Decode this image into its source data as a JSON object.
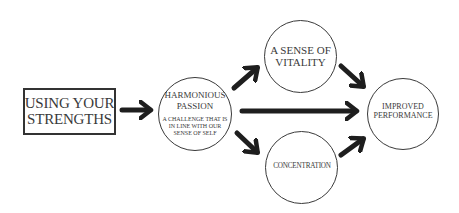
{
  "diagram": {
    "colors": {
      "stroke": "#333333",
      "text": "#3a3a3a",
      "arrow": "#1e1e1e",
      "background": "#ffffff"
    },
    "nodes": [
      {
        "id": "strengths",
        "shape": "rectangle",
        "lines": [
          "USING YOUR",
          "STRENGTHS"
        ]
      },
      {
        "id": "passion",
        "shape": "circle",
        "lines": [
          "HARMONIOUS",
          "PASSION"
        ],
        "sublines": [
          "A CHALLENGE THAT IS",
          "IN LINE WITH OUR",
          "SENSE OF SELF"
        ]
      },
      {
        "id": "vitality",
        "shape": "circle",
        "lines": [
          "A SENSE OF",
          "VITALITY"
        ]
      },
      {
        "id": "concentration",
        "shape": "circle",
        "lines": [
          "CONCENTRATION"
        ]
      },
      {
        "id": "performance",
        "shape": "circle",
        "lines": [
          "IMPROVED",
          "PERFORMANCE"
        ]
      }
    ],
    "edges": [
      {
        "from": "strengths",
        "to": "passion"
      },
      {
        "from": "passion",
        "to": "vitality"
      },
      {
        "from": "passion",
        "to": "performance"
      },
      {
        "from": "passion",
        "to": "concentration"
      },
      {
        "from": "vitality",
        "to": "performance"
      },
      {
        "from": "concentration",
        "to": "performance"
      }
    ]
  }
}
